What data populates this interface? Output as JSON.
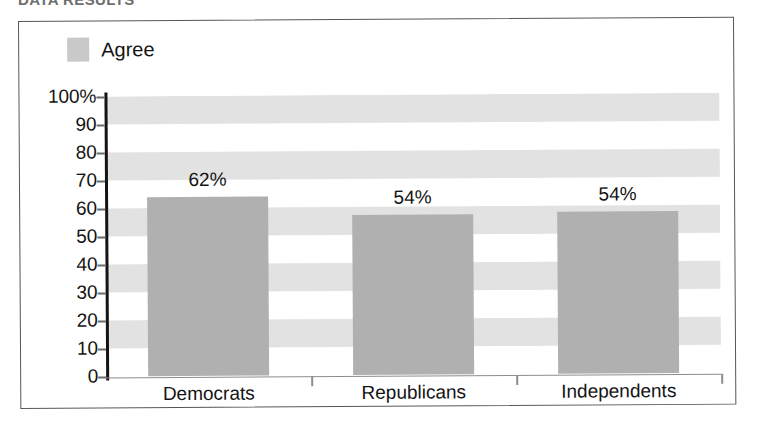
{
  "caption": {
    "text": "DATA RESULTS"
  },
  "chart_data": {
    "type": "bar",
    "title": "",
    "subtitle": "",
    "xlabel": "",
    "ylabel": "",
    "categories": [
      "Democrats",
      "Republicans",
      "Independents"
    ],
    "series": [
      {
        "name": "Agree",
        "color": "#b0b0b0",
        "values": [
          62,
          54,
          54
        ],
        "value_labels": [
          "62%",
          "54%",
          "54%"
        ],
        "bar_tops_percent": [
          64,
          57,
          58
        ]
      }
    ],
    "ylim": [
      0,
      100
    ],
    "ytick_values": [
      0,
      10,
      20,
      30,
      40,
      50,
      60,
      70,
      80,
      90,
      100
    ],
    "ytick_labels": [
      "0",
      "10",
      "20",
      "30",
      "40",
      "50",
      "60",
      "70",
      "80",
      "90",
      "100%"
    ],
    "grid": "horizontal-bands",
    "band_color": "#e2e2e2",
    "legend": {
      "position": "top-left",
      "entries": [
        {
          "label": "Agree",
          "color": "#c9c9c9"
        }
      ]
    },
    "frame": {
      "border_color": "#575757"
    }
  }
}
